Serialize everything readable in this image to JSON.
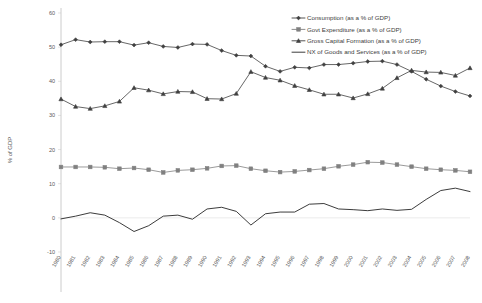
{
  "chart_data": {
    "type": "line",
    "title": "",
    "xlabel": "",
    "ylabel": "% of GDP",
    "ylim": [
      -10,
      60
    ],
    "yticks": [
      -10,
      0,
      10,
      20,
      30,
      40,
      50,
      60
    ],
    "grid": false,
    "legend_position": "top-right",
    "x": [
      1980,
      1981,
      1982,
      1983,
      1984,
      1985,
      1986,
      1987,
      1988,
      1989,
      1990,
      1991,
      1992,
      1993,
      1994,
      1995,
      1996,
      1997,
      1998,
      1999,
      2000,
      2001,
      2002,
      2003,
      2004,
      2005,
      2006,
      2007,
      2008
    ],
    "categories": [
      "1980",
      "1981",
      "1982",
      "1983",
      "1984",
      "1985",
      "1986",
      "1987",
      "1988",
      "1989",
      "1990",
      "1991",
      "1992",
      "1993",
      "1994",
      "1995",
      "1996",
      "1997",
      "1998",
      "1999",
      "2000",
      "2001",
      "2002",
      "2003",
      "2004",
      "2005",
      "2006",
      "2007",
      "2008"
    ],
    "series": [
      {
        "name": "Consumption (as a % of GDP)",
        "color": "#404040",
        "marker": "diamond",
        "values": [
          50.7,
          52.2,
          51.5,
          51.6,
          51.6,
          50.6,
          51.3,
          50.2,
          49.9,
          50.9,
          50.8,
          49.0,
          47.6,
          47.4,
          44.4,
          42.9,
          44.1,
          43.9,
          44.9,
          44.9,
          45.3,
          45.8,
          45.9,
          44.9,
          42.9,
          40.6,
          38.6,
          37.0,
          35.7
        ]
      },
      {
        "name": "Govt Expenditure (as a % of GDP)",
        "color": "#808080",
        "marker": "square",
        "values": [
          14.9,
          14.9,
          14.9,
          14.8,
          14.4,
          14.6,
          14.1,
          13.3,
          13.9,
          14.1,
          14.5,
          15.2,
          15.3,
          14.4,
          13.8,
          13.4,
          13.6,
          14.0,
          14.4,
          15.1,
          15.6,
          16.3,
          16.2,
          15.6,
          15.0,
          14.4,
          14.1,
          13.9,
          13.5
        ]
      },
      {
        "name": "Gross Capital Formation (as a % of GDP)",
        "color": "#404040",
        "marker": "triangle",
        "values": [
          34.8,
          32.6,
          32.0,
          32.8,
          34.1,
          38.1,
          37.4,
          36.3,
          37.0,
          36.9,
          34.9,
          34.8,
          36.4,
          42.8,
          41.1,
          40.3,
          38.7,
          37.5,
          36.2,
          36.2,
          35.1,
          36.3,
          37.9,
          41.0,
          43.2,
          42.7,
          42.6,
          41.7,
          43.9
        ]
      },
      {
        "name": "NX of Goods and Services (as a % of GDP)",
        "color": "#262626",
        "marker": "none",
        "values": [
          -0.3,
          0.5,
          1.5,
          0.8,
          -1.4,
          -4.0,
          -2.3,
          0.5,
          0.8,
          -0.4,
          2.6,
          3.1,
          1.9,
          -2.1,
          1.2,
          1.7,
          1.7,
          4.0,
          4.2,
          2.6,
          2.4,
          2.1,
          2.6,
          2.2,
          2.5,
          5.4,
          8.0,
          8.7,
          7.7
        ]
      }
    ]
  },
  "legend": {
    "items": [
      {
        "label": "Consumption (as a % of GDP)"
      },
      {
        "label": "Govt Expenditure (as a % of GDP)"
      },
      {
        "label": "Gross Capital Formation (as a % of GDP)"
      },
      {
        "label": "NX of Goods and Services (as a % of GDP)"
      }
    ]
  }
}
